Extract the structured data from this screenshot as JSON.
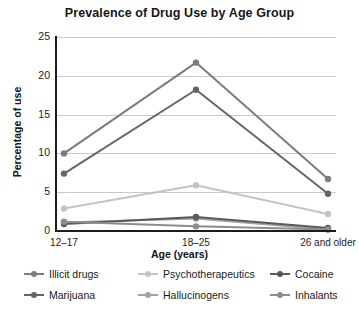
{
  "chart_data": {
    "type": "line",
    "title": "Prevalence of Drug Use by Age Group",
    "xlabel": "Age (years)",
    "ylabel": "Percentage of use",
    "categories": [
      "12–17",
      "18–25",
      "26 and older"
    ],
    "ylim": [
      0,
      25
    ],
    "yticks": [
      0,
      5,
      10,
      15,
      20,
      25
    ],
    "grid": true,
    "legend_position": "bottom",
    "series": [
      {
        "name": "Illicit drugs",
        "values": [
          10.0,
          21.7,
          6.7
        ],
        "color": "#7c7c7c"
      },
      {
        "name": "Marijuana",
        "values": [
          7.4,
          18.2,
          4.8
        ],
        "color": "#666666"
      },
      {
        "name": "Psychotherapeutics",
        "values": [
          2.9,
          5.9,
          2.2
        ],
        "color": "#c4c4c4"
      },
      {
        "name": "Hallucinogens",
        "values": [
          1.1,
          1.6,
          0.2
        ],
        "color": "#a3a3a3"
      },
      {
        "name": "Cocaine",
        "values": [
          0.9,
          1.8,
          0.4
        ],
        "color": "#5a5a5a"
      },
      {
        "name": "Inhalants",
        "values": [
          1.2,
          0.6,
          0.2
        ],
        "color": "#8d8d8d"
      }
    ]
  },
  "colors": {
    "grid": "#c9c9c9",
    "axis": "#1c1c1c",
    "background": "#ffffff",
    "text": "#1a1a1a"
  }
}
